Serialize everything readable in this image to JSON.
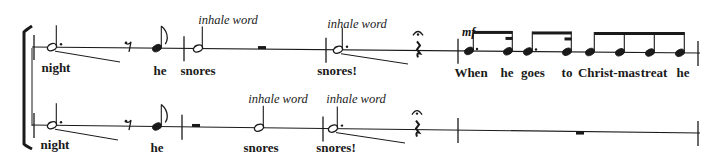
{
  "score": {
    "color": "#1a1a1a",
    "bracket": {
      "x": 24,
      "top": 30,
      "bottom": 146
    },
    "staves": [
      {
        "name": "upper",
        "line": {
          "x1": 32,
          "y1": 47,
          "x2": 700,
          "y2": 53
        },
        "barlines": [
          34,
          184,
          326,
          458,
          698
        ],
        "notes": [
          {
            "type": "dotted-half",
            "x": 52,
            "stem": "up",
            "lyric": "night",
            "slide": {
              "x2": 120,
              "y2": 62
            }
          },
          {
            "type": "eighth-rest",
            "x": 128
          },
          {
            "type": "eighth",
            "x": 157,
            "stem": "up",
            "lyric": "he"
          },
          {
            "type": "half",
            "x": 198,
            "stem": "up",
            "lyric": "snores",
            "annotation": "inhale word"
          },
          {
            "type": "half-rest",
            "x": 262
          },
          {
            "type": "dotted-half",
            "x": 338,
            "stem": "up",
            "lyric": "snores!",
            "annotation": "inhale word",
            "slide": {
              "x2": 408,
              "y2": 64
            }
          },
          {
            "type": "quarter-rest",
            "x": 418,
            "fermata": true
          },
          {
            "type": "beamed-group",
            "dynamic": "mf",
            "notes": [
              {
                "x": 469,
                "lyric": "When",
                "dot": true
              },
              {
                "x": 508,
                "lyric": "he",
                "sixteenth": true
              },
              {
                "x": 528,
                "lyric": "goes",
                "dot": true
              },
              {
                "x": 567,
                "lyric": "to",
                "sixteenth": true
              }
            ]
          },
          {
            "type": "beamed-four",
            "notes": [
              {
                "x": 590,
                "lyric": "Christ-mas"
              },
              {
                "x": 620,
                "lyric": ""
              },
              {
                "x": 650,
                "lyric": "treat"
              },
              {
                "x": 680,
                "lyric": "he"
              }
            ]
          }
        ]
      },
      {
        "name": "lower",
        "line": {
          "x1": 32,
          "y1": 125,
          "x2": 700,
          "y2": 133
        },
        "barlines": [
          34,
          182,
          323,
          458,
          698
        ],
        "notes": [
          {
            "type": "dotted-half",
            "x": 52,
            "stem": "up",
            "lyric": "night",
            "slide": {
              "x2": 118,
              "y2": 140
            }
          },
          {
            "type": "eighth-rest",
            "x": 128
          },
          {
            "type": "eighth",
            "x": 157,
            "stem": "up",
            "lyric": "he"
          },
          {
            "type": "half-rest",
            "x": 196
          },
          {
            "type": "half",
            "x": 259,
            "stem": "up",
            "lyric": "snores",
            "annotation": "inhale word"
          },
          {
            "type": "dotted-half",
            "x": 333,
            "stem": "up",
            "lyric": "snores!",
            "annotation": "inhale word",
            "slide": {
              "x2": 405,
              "y2": 143
            }
          },
          {
            "type": "quarter-rest",
            "x": 417,
            "fermata": true
          },
          {
            "type": "whole-rest",
            "x": 580
          }
        ]
      }
    ]
  },
  "text": {
    "upper": {
      "lyric_night": "night",
      "lyric_he": "he",
      "lyric_snores": "snores",
      "lyric_snores_excl": "snores!",
      "annot_1": "inhale word",
      "annot_2": "inhale word",
      "dynamic": "mf",
      "lyric_when": "When",
      "lyric_he2": "he",
      "lyric_goes": "goes",
      "lyric_to": "to",
      "lyric_christmas": "Christ-mas",
      "lyric_treat": "treat",
      "lyric_he3": "he"
    },
    "lower": {
      "lyric_night": "night",
      "lyric_he": "he",
      "lyric_snores": "snores",
      "lyric_snores_excl": "snores!",
      "annot_1": "inhale word",
      "annot_2": "inhale word"
    }
  }
}
